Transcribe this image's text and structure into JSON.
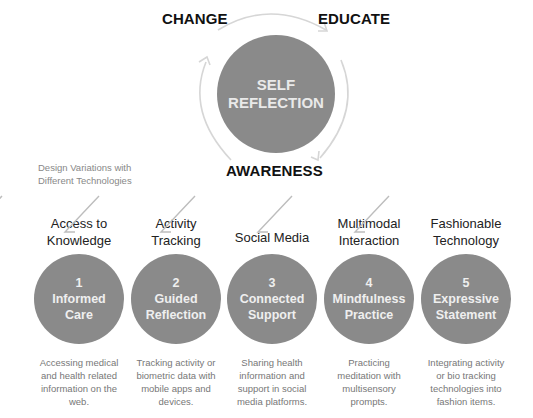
{
  "center": {
    "line1": "SELF",
    "line2": "REFLECTION"
  },
  "cycle_labels": {
    "change": "CHANGE",
    "educate": "EDUCATE",
    "awareness": "AWARENESS"
  },
  "subtitle": {
    "line1": "Design Variations with",
    "line2": "Different Technologies"
  },
  "columns": [
    {
      "category_line1": "Access to",
      "category_line2": "Knowledge",
      "number": "1",
      "name_line1": "Informed",
      "name_line2": "Care",
      "desc_line1": "Accessing medical",
      "desc_line2": "and health related",
      "desc_line3": "information on the",
      "desc_line4": "web."
    },
    {
      "category_line1": "Activity",
      "category_line2": "Tracking",
      "number": "2",
      "name_line1": "Guided",
      "name_line2": "Reflection",
      "desc_line1": "Tracking activity or",
      "desc_line2": "biometric data with",
      "desc_line3": "mobile apps and",
      "desc_line4": "devices."
    },
    {
      "category_line1": "Social Media",
      "category_line2": "",
      "number": "3",
      "name_line1": "Connected",
      "name_line2": "Support",
      "desc_line1": "Sharing health",
      "desc_line2": "information and",
      "desc_line3": "support in social",
      "desc_line4": "media platforms."
    },
    {
      "category_line1": "Multimodal",
      "category_line2": "Interaction",
      "number": "4",
      "name_line1": "Mindfulness",
      "name_line2": "Practice",
      "desc_line1": "Practicing",
      "desc_line2": "meditation with",
      "desc_line3": "multisensory",
      "desc_line4": "prompts."
    },
    {
      "category_line1": "Fashionable",
      "category_line2": "Technology",
      "number": "5",
      "name_line1": "Expressive",
      "name_line2": "Statement",
      "desc_line1": "Integrating activity",
      "desc_line2": "or bio tracking",
      "desc_line3": "technologies into",
      "desc_line4": "fashion items."
    }
  ],
  "colors": {
    "circle_fill": "#8a8a8a",
    "circle_text": "#efefef",
    "arrow_stroke": "#d4d4d4",
    "muted_text": "#888888"
  }
}
